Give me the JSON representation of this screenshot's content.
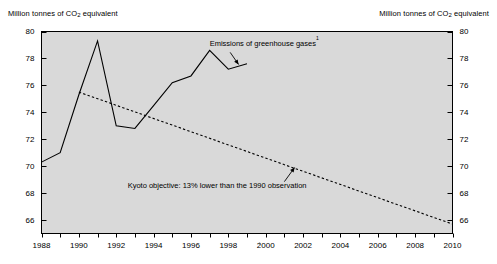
{
  "left_axis_title": "Million tonnes of CO2 equivalent",
  "right_axis_title": "Million tonnes of CO2 equivalent",
  "chart_data": {
    "type": "line",
    "title": "",
    "subtitle": "",
    "xlabel": "",
    "ylabel": "Million tonnes of CO2 equivalent",
    "ylabel_right": "Million tonnes of CO2 equivalent",
    "xlim": [
      1988,
      2010
    ],
    "ylim": [
      65,
      80
    ],
    "ytick_values": [
      66,
      68,
      70,
      72,
      74,
      76,
      78,
      80
    ],
    "ytick_labels": [
      "66",
      "68",
      "70",
      "72",
      "74",
      "76",
      "78",
      "80"
    ],
    "xtick_values": [
      1988,
      1990,
      1992,
      1994,
      1996,
      1998,
      2000,
      2002,
      2004,
      2006,
      2008,
      2010
    ],
    "xtick_labels": [
      "1988",
      "1990",
      "1992",
      "1994",
      "1996",
      "1998",
      "2000",
      "2002",
      "2004",
      "2006",
      "2008",
      "2010"
    ],
    "x_minor_tick_step": 1,
    "grid": false,
    "legend_position": "inline-annotations",
    "plot_background": "#d9d9d9",
    "series": [
      {
        "name": "Emissions of greenhouse gases",
        "style": "solid",
        "color": "#000000",
        "x": [
          1988,
          1989,
          1990,
          1991,
          1992,
          1993,
          1994,
          1995,
          1996,
          1997,
          1998,
          1999
        ],
        "values": [
          70.3,
          71.0,
          75.3,
          79.3,
          73.0,
          72.8,
          74.5,
          76.2,
          76.7,
          78.6,
          77.2,
          77.6
        ]
      },
      {
        "name": "Kyoto objective: 13% lower than the 1990 observation",
        "style": "dotted",
        "color": "#000000",
        "x": [
          1990,
          2010
        ],
        "values": [
          75.5,
          65.7
        ]
      }
    ],
    "annotations": [
      {
        "name": "emissions-label",
        "text": "Emissions of greenhouse gases",
        "footnote_marker": "1",
        "text_x": 1997.0,
        "text_y": 78.95,
        "arrow_from_x": 1998.1,
        "arrow_from_y": 78.45,
        "arrow_to_x": 1998.55,
        "arrow_to_y": 77.55
      },
      {
        "name": "kyoto-label",
        "text": "Kyoto objective: 13% lower than the 1990 observation",
        "footnote_marker": "",
        "text_x": 1997.4,
        "text_y": 68.35,
        "arrow_from_x": 2001.0,
        "arrow_from_y": 68.85,
        "arrow_to_x": 2001.55,
        "arrow_to_y": 69.9
      }
    ]
  }
}
